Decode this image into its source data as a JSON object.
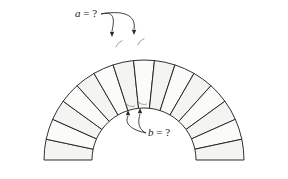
{
  "figure": {
    "background_color": "#ffffff"
  },
  "arch": {
    "type": "semicircular-voussoir-arch",
    "voussoir_count": 15,
    "inner_radius": 52,
    "outer_radius": 100,
    "center_x": 144,
    "center_y": 160,
    "start_angle_deg": 180,
    "end_angle_deg": 0,
    "stroke_color": "#1a1a1a",
    "fill_color": "#f4f4f2",
    "fill_color_alt": "#fbfbfa",
    "stroke_width": 0.9
  },
  "annotations": {
    "a": {
      "label_var": "a",
      "label_eq": " = ?",
      "label_full": "a = ?",
      "text_x": 75,
      "text_y": 17,
      "target": "extrados-wedge-angle",
      "arrow_tips": [
        {
          "x": 112,
          "y": 37
        },
        {
          "x": 134,
          "y": 35
        }
      ],
      "arc_marks": [
        {
          "cx": 112,
          "cy": 37
        },
        {
          "cx": 134,
          "cy": 35
        }
      ]
    },
    "b": {
      "label_var": "b",
      "label_eq": " = ?",
      "label_full": "b = ?",
      "text_x": 148,
      "text_y": 136,
      "target": "intrados-wedge-angle",
      "arrow_tips": [
        {
          "x": 128,
          "y": 110
        },
        {
          "x": 140,
          "y": 108
        }
      ],
      "arc_marks": [
        {
          "cx": 128,
          "cy": 110
        },
        {
          "cx": 140,
          "cy": 108
        }
      ]
    }
  },
  "colors": {
    "ink": "#1a1a1a",
    "stone_fill": "#f4f4f2",
    "stone_fill_alt": "#fbfbfa",
    "leader": "#2a2a2a"
  }
}
